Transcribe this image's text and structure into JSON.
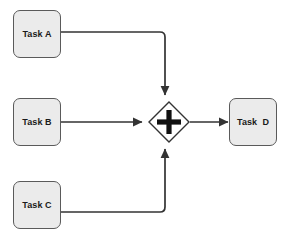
{
  "diagram": {
    "notation": "BPMN",
    "background_color": "#ffffff",
    "node_fill_color": "#ebebeb",
    "node_border_color": "#5a5a5a",
    "gateway_fill_color": "#ffffff",
    "edge_color": "#333333",
    "text_color": "#1a1a1a"
  },
  "nodes": {
    "task_a": {
      "label": "Task A",
      "type": "task"
    },
    "task_b": {
      "label": "Task B",
      "type": "task"
    },
    "task_c": {
      "label": "Task C",
      "type": "task"
    },
    "task_d": {
      "label": "Task  D",
      "type": "task"
    },
    "gateway": {
      "label": "+",
      "type": "parallel-gateway",
      "symbol": "plus"
    }
  },
  "edges": [
    {
      "from": "task_a",
      "to": "gateway",
      "routing": "right-then-down",
      "arrow": "into-gateway-top"
    },
    {
      "from": "task_b",
      "to": "gateway",
      "routing": "straight-right",
      "arrow": "into-gateway-left"
    },
    {
      "from": "task_c",
      "to": "gateway",
      "routing": "right-then-up",
      "arrow": "into-gateway-bottom"
    },
    {
      "from": "gateway",
      "to": "task_d",
      "routing": "straight-right",
      "arrow": "into-task-left"
    }
  ]
}
